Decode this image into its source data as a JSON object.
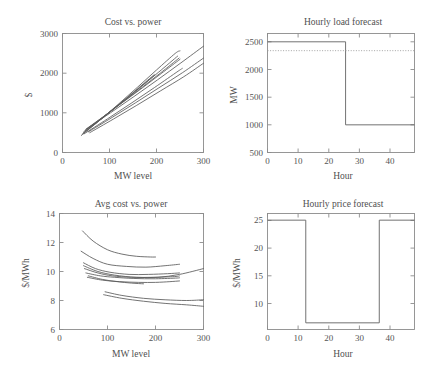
{
  "figure": {
    "background": "#ffffff",
    "line_color": "#5a5a5a",
    "axis_color": "#8c8c8c",
    "text_color": "#4f4f4f"
  },
  "chart_data": [
    {
      "id": "cost-vs-power",
      "type": "line",
      "title": "Cost vs. power",
      "xlabel": "MW level",
      "ylabel": "$",
      "xlim": [
        0,
        300
      ],
      "ylim": [
        0,
        3000
      ],
      "xticks": [
        0,
        100,
        200,
        300
      ],
      "yticks": [
        0,
        1000,
        2000,
        3000
      ],
      "xticklabels": [
        "0",
        "100",
        "200",
        "300"
      ],
      "yticklabels": [
        "0",
        "1000",
        "2000",
        "3000"
      ],
      "grid": false,
      "legend": "none",
      "series": [
        {
          "name": "unit 1",
          "x": [
            40,
            80,
            120,
            160,
            200,
            240,
            250
          ],
          "y": [
            430,
            820,
            1230,
            1650,
            2080,
            2500,
            2560
          ]
        },
        {
          "name": "unit 2",
          "x": [
            45,
            85,
            125,
            165,
            205,
            245
          ],
          "y": [
            520,
            880,
            1260,
            1640,
            2030,
            2430
          ]
        },
        {
          "name": "unit 3",
          "x": [
            48,
            88,
            128,
            168,
            208,
            248
          ],
          "y": [
            560,
            910,
            1270,
            1630,
            2000,
            2380
          ]
        },
        {
          "name": "unit 4",
          "x": [
            50,
            90,
            130,
            170,
            210,
            250
          ],
          "y": [
            590,
            930,
            1280,
            1630,
            1990,
            2350
          ]
        },
        {
          "name": "unit 5",
          "x": [
            44,
            84,
            124,
            164,
            196
          ],
          "y": [
            490,
            860,
            1240,
            1630,
            1950
          ]
        },
        {
          "name": "unit 6",
          "x": [
            42,
            82,
            122,
            162,
            195
          ],
          "y": [
            460,
            840,
            1230,
            1630,
            1960
          ]
        },
        {
          "name": "unit 7",
          "x": [
            52,
            102,
            152,
            202,
            252,
            300
          ],
          "y": [
            600,
            1000,
            1410,
            1830,
            2260,
            2680
          ]
        },
        {
          "name": "unit 8",
          "x": [
            55,
            105,
            155,
            205,
            255,
            300
          ],
          "y": [
            520,
            880,
            1250,
            1630,
            2010,
            2380
          ]
        },
        {
          "name": "unit 9",
          "x": [
            58,
            108,
            158,
            208,
            258,
            300
          ],
          "y": [
            500,
            840,
            1190,
            1550,
            1910,
            2250
          ]
        },
        {
          "name": "unit 10",
          "x": [
            46,
            96,
            146,
            196,
            246,
            255
          ],
          "y": [
            470,
            850,
            1240,
            1640,
            2050,
            2120
          ]
        }
      ]
    },
    {
      "id": "hourly-load-forecast",
      "type": "line",
      "title": "Hourly load forecast",
      "xlabel": "Hour",
      "ylabel": "MW",
      "xlim": [
        0,
        48
      ],
      "ylim": [
        500,
        2650
      ],
      "xticks": [
        0,
        10,
        20,
        30,
        40
      ],
      "yticks": [
        500,
        1000,
        1500,
        2000,
        2500
      ],
      "xticklabels": [
        "0",
        "10",
        "20",
        "30",
        "40"
      ],
      "yticklabels": [
        "500",
        "1000",
        "1500",
        "2000",
        "2500"
      ],
      "grid": false,
      "legend": "none",
      "series": [
        {
          "name": "load",
          "style": "step",
          "x": [
            0,
            25.5,
            25.5,
            48
          ],
          "y": [
            2500,
            2500,
            1000,
            1000
          ]
        },
        {
          "name": "reference capacity",
          "style": "dotted",
          "x": [
            0,
            48
          ],
          "y": [
            2340,
            2340
          ]
        }
      ]
    },
    {
      "id": "avg-cost-vs-power",
      "type": "line",
      "title": "Avg cost vs. power",
      "xlabel": "MW level",
      "ylabel": "$/MWh",
      "xlim": [
        0,
        300
      ],
      "ylim": [
        6,
        14
      ],
      "xticks": [
        0,
        100,
        200,
        300
      ],
      "yticks": [
        6,
        8,
        10,
        12,
        14
      ],
      "xticklabels": [
        "0",
        "100",
        "200",
        "300"
      ],
      "yticklabels": [
        "6",
        "8",
        "10",
        "12",
        "14"
      ],
      "grid": false,
      "legend": "none",
      "series": [
        {
          "name": "unit 1",
          "x": [
            48,
            70,
            100,
            130,
            160,
            190,
            200
          ],
          "y": [
            12.8,
            12.1,
            11.5,
            11.2,
            11.05,
            11.0,
            11.0
          ]
        },
        {
          "name": "unit 2",
          "x": [
            45,
            70,
            100,
            140,
            180,
            220,
            250
          ],
          "y": [
            11.4,
            10.9,
            10.5,
            10.35,
            10.3,
            10.4,
            10.5
          ]
        },
        {
          "name": "unit 3",
          "x": [
            50,
            75,
            105,
            145,
            185,
            225,
            250
          ],
          "y": [
            10.6,
            10.2,
            9.95,
            9.8,
            9.8,
            9.85,
            9.9
          ]
        },
        {
          "name": "unit 4",
          "x": [
            52,
            80,
            110,
            150,
            195,
            240,
            250
          ],
          "y": [
            10.2,
            9.9,
            9.7,
            9.6,
            9.6,
            9.65,
            9.7
          ]
        },
        {
          "name": "unit 5",
          "x": [
            55,
            85,
            115,
            155,
            200,
            245,
            250
          ],
          "y": [
            9.9,
            9.7,
            9.6,
            9.52,
            9.5,
            9.55,
            9.58
          ]
        },
        {
          "name": "unit 6",
          "x": [
            50,
            80,
            115,
            160,
            205,
            250,
            300
          ],
          "y": [
            10.4,
            10.0,
            9.75,
            9.6,
            9.6,
            9.8,
            10.2
          ]
        },
        {
          "name": "unit 7",
          "x": [
            58,
            90,
            125,
            165,
            200,
            230,
            250
          ],
          "y": [
            9.6,
            9.4,
            9.3,
            9.25,
            9.25,
            9.3,
            9.35
          ]
        },
        {
          "name": "unit 8",
          "x": [
            60,
            90,
            120,
            150,
            175
          ],
          "y": [
            9.7,
            9.45,
            9.3,
            9.2,
            9.15
          ]
        },
        {
          "name": "unit 9",
          "x": [
            95,
            130,
            175,
            220,
            265,
            300
          ],
          "y": [
            8.6,
            8.35,
            8.15,
            8.05,
            8.0,
            8.05
          ]
        },
        {
          "name": "unit 10",
          "x": [
            92,
            130,
            175,
            220,
            265,
            300
          ],
          "y": [
            8.4,
            8.15,
            7.95,
            7.8,
            7.7,
            7.6
          ]
        }
      ]
    },
    {
      "id": "hourly-price-forecast",
      "type": "line",
      "title": "Hourly price forecast",
      "xlabel": "Hour",
      "ylabel": "$/MWh",
      "xlim": [
        0,
        48
      ],
      "ylim": [
        5.3,
        26.2
      ],
      "xticks": [
        0,
        10,
        20,
        30,
        40
      ],
      "yticks": [
        10,
        15,
        20,
        25
      ],
      "xticklabels": [
        "0",
        "10",
        "20",
        "30",
        "40"
      ],
      "yticklabels": [
        "10",
        "15",
        "20",
        "25"
      ],
      "grid": false,
      "legend": "none",
      "series": [
        {
          "name": "price",
          "style": "step",
          "x": [
            0,
            12.5,
            12.5,
            36.5,
            36.5,
            48
          ],
          "y": [
            25,
            25,
            6.5,
            6.5,
            25,
            25
          ]
        }
      ]
    }
  ]
}
